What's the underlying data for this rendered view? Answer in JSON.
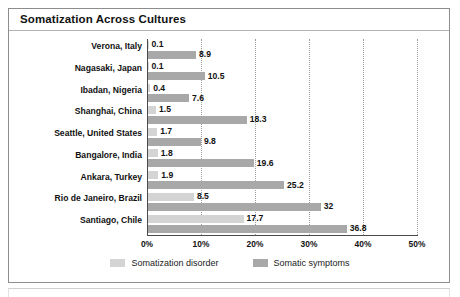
{
  "figure": {
    "title": "Somatization Across Cultures",
    "border_color": "#8d8d8d",
    "background": "#ffffff"
  },
  "chart_data": {
    "type": "bar",
    "orientation": "horizontal",
    "title": "Somatization Across Cultures",
    "xlabel": "",
    "ylabel": "",
    "xlim": [
      0,
      50
    ],
    "x_unit": "%",
    "xticks": [
      "0%",
      "10%",
      "20%",
      "30%",
      "40%",
      "50%"
    ],
    "xtick_values": [
      0,
      10,
      20,
      30,
      40,
      50
    ],
    "grid": "vertical-dotted",
    "legend_position": "bottom-center",
    "categories": [
      "Verona, Italy",
      "Nagasaki, Japan",
      "Ibadan, Nigeria",
      "Shanghai, China",
      "Seattle, United States",
      "Bangalore, India",
      "Ankara, Turkey",
      "Rio de Janeiro, Brazil",
      "Santiago, Chile"
    ],
    "series": [
      {
        "name": "Somatization disorder",
        "color": "#d4d4d4",
        "values": [
          0.1,
          0.1,
          0.4,
          1.5,
          1.7,
          1.8,
          1.9,
          8.5,
          17.7
        ],
        "labels": [
          "0.1",
          "0.1",
          "0.4",
          "1.5",
          "1.7",
          "1.8",
          "1.9",
          "8.5",
          "17.7"
        ]
      },
      {
        "name": "Somatic symptoms",
        "color": "#a8a8a8",
        "values": [
          8.9,
          10.5,
          7.6,
          18.3,
          9.8,
          19.6,
          25.2,
          32,
          36.8
        ],
        "labels": [
          "8.9",
          "10.5",
          "7.6",
          "18.3",
          "9.8",
          "19.6",
          "25.2",
          "32",
          "36.8"
        ]
      }
    ]
  },
  "legend": {
    "items": [
      {
        "label": "Somatization disorder",
        "color": "#d4d4d4"
      },
      {
        "label": "Somatic symptoms",
        "color": "#a8a8a8"
      }
    ]
  }
}
